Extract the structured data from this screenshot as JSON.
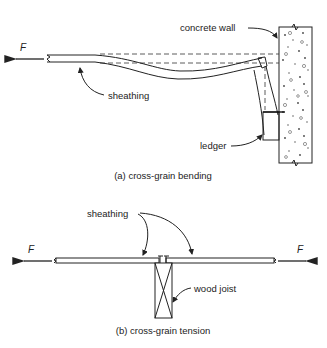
{
  "figure_a": {
    "caption": "(a) cross-grain bending",
    "labels": {
      "concrete_wall": "concrete wall",
      "sheathing": "sheathing",
      "ledger": "ledger",
      "force": "F"
    }
  },
  "figure_b": {
    "caption": "(b) cross-grain tension",
    "labels": {
      "sheathing": "sheathing",
      "wood_joist": "wood joist",
      "force_left": "F",
      "force_right": "F"
    }
  },
  "colors": {
    "line": "#222222",
    "background": "#ffffff"
  }
}
